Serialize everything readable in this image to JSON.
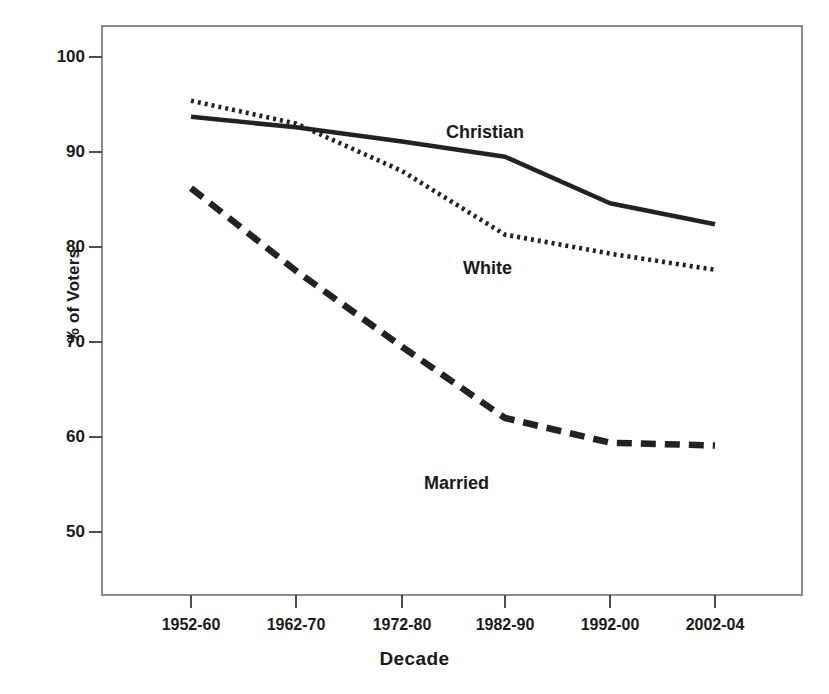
{
  "chart_data": {
    "type": "line",
    "title": "",
    "xlabel": "Decade",
    "ylabel": "% of Voters",
    "categories": [
      "1952-60",
      "1962-70",
      "1972-80",
      "1982-90",
      "1992-00",
      "2002-04"
    ],
    "ylim": [
      46,
      103
    ],
    "yticks": [
      50,
      60,
      70,
      80,
      90,
      100
    ],
    "ytick_labels": [
      "50",
      "60",
      "70",
      "80",
      "90",
      "100"
    ],
    "grid": false,
    "legend_position": "inline-annotations",
    "series": [
      {
        "name": "Christian",
        "style": "solid",
        "color": "#222222",
        "values": [
          93.7,
          92.6,
          91.1,
          89.5,
          84.6,
          82.4
        ]
      },
      {
        "name": "White",
        "style": "dotted",
        "color": "#222222",
        "values": [
          95.4,
          93.0,
          88.0,
          81.3,
          79.3,
          77.6
        ]
      },
      {
        "name": "Married",
        "style": "dashed",
        "color": "#222222",
        "values": [
          86.2,
          77.5,
          69.5,
          62.0,
          59.4,
          59.1
        ]
      }
    ],
    "annotations": [
      {
        "text": "Christian",
        "x": 446,
        "y": 122
      },
      {
        "text": "White",
        "x": 463,
        "y": 258
      },
      {
        "text": "Married",
        "x": 424,
        "y": 473
      }
    ]
  },
  "axis": {
    "y_title": "% of Voters",
    "x_title": "Decade"
  }
}
